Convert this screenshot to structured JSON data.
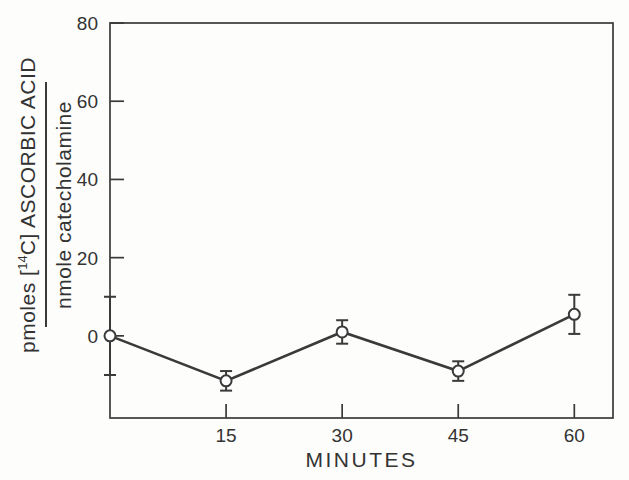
{
  "figure": {
    "background": "#fdfdfb",
    "ink_color": "#3a3a3a",
    "text_color": "#333333"
  },
  "y_axis_label": {
    "numerator_prefix": "pmoles [",
    "isotope": "14",
    "numerator_suffix": "C] ASCORBIC ACID",
    "denominator": "nmole catecholamine"
  },
  "chart_data": {
    "type": "line",
    "title": "",
    "xlabel": "MINUTES",
    "ylabel": "pmoles [14C] ASCORBIC ACID / nmole catecholamine",
    "x": [
      0,
      15,
      30,
      45,
      60
    ],
    "y": [
      0,
      -11.5,
      1,
      -9,
      5.5
    ],
    "yerr": [
      10,
      2.5,
      3,
      2.5,
      5
    ],
    "x_ticks": [
      15,
      30,
      45,
      60
    ],
    "y_ticks": [
      0,
      20,
      40,
      60,
      80
    ],
    "xlim": [
      0,
      65
    ],
    "ylim": [
      -21,
      80
    ],
    "marker": "open-circle",
    "marker_fill": "#ffffff",
    "line_color": "#3a3a3a",
    "grid": false,
    "error_bars": true,
    "legend": null
  }
}
